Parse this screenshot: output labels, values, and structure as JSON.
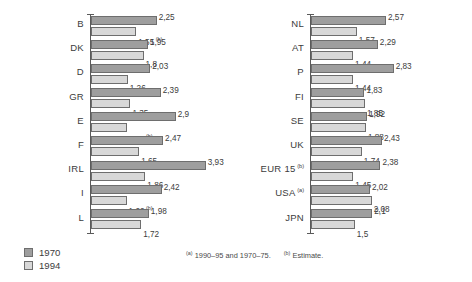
{
  "chart_data": {
    "type": "bar",
    "orientation": "horizontal",
    "title": "",
    "xlabel": "",
    "ylabel": "",
    "grid": false,
    "xlim": [
      0,
      4
    ],
    "legend_position": "bottom-left",
    "series": [
      {
        "name": "1970",
        "color": "#9e9e9e"
      },
      {
        "name": "1994",
        "color": "#d8d8d8"
      }
    ],
    "panels": [
      {
        "id": "left",
        "categories": [
          "B",
          "DK",
          "D",
          "GR",
          "E",
          "F",
          "IRL",
          "I",
          "L"
        ],
        "values_1970": [
          2.25,
          1.95,
          2.03,
          2.39,
          2.9,
          2.47,
          3.93,
          2.42,
          1.98
        ],
        "values_1994": [
          1.55,
          1.8,
          1.26,
          1.35,
          1.22,
          1.65,
          1.86,
          1.22,
          1.72
        ],
        "rows": [
          {
            "label": "B",
            "label_note": "",
            "a": {
              "value": 2.25,
              "text": "2,25",
              "note": ""
            },
            "b": {
              "value": 1.55,
              "text": "1,55",
              "note": "(b)"
            }
          },
          {
            "label": "DK",
            "label_note": "",
            "a": {
              "value": 1.95,
              "text": "1,95",
              "note": ""
            },
            "b": {
              "value": 1.8,
              "text": "1,8",
              "note": ""
            }
          },
          {
            "label": "D",
            "label_note": "",
            "a": {
              "value": 2.03,
              "text": "2,03",
              "note": ""
            },
            "b": {
              "value": 1.26,
              "text": "1,26",
              "note": ""
            }
          },
          {
            "label": "GR",
            "label_note": "",
            "a": {
              "value": 2.39,
              "text": "2,39",
              "note": ""
            },
            "b": {
              "value": 1.35,
              "text": "1,35",
              "note": ""
            }
          },
          {
            "label": "E",
            "label_note": "",
            "a": {
              "value": 2.9,
              "text": "2,9",
              "note": ""
            },
            "b": {
              "value": 1.22,
              "text": "1,22",
              "note": "(b)"
            }
          },
          {
            "label": "F",
            "label_note": "",
            "a": {
              "value": 2.47,
              "text": "2,47",
              "note": ""
            },
            "b": {
              "value": 1.65,
              "text": "1,65",
              "note": ""
            }
          },
          {
            "label": "IRL",
            "label_note": "",
            "a": {
              "value": 3.93,
              "text": "3,93",
              "note": ""
            },
            "b": {
              "value": 1.86,
              "text": "1,86",
              "note": ""
            }
          },
          {
            "label": "I",
            "label_note": "",
            "a": {
              "value": 2.42,
              "text": "2,42",
              "note": ""
            },
            "b": {
              "value": 1.22,
              "text": "1,22",
              "note": "(b)"
            }
          },
          {
            "label": "L",
            "label_note": "",
            "a": {
              "value": 1.98,
              "text": "1,98",
              "note": ""
            },
            "b": {
              "value": 1.72,
              "text": "1,72",
              "note": ""
            }
          }
        ]
      },
      {
        "id": "right",
        "categories": [
          "NL",
          "AT",
          "P",
          "FI",
          "SE",
          "UK",
          "EUR 15",
          "USA",
          "JPN"
        ],
        "values_1970": [
          2.57,
          2.29,
          2.83,
          1.83,
          1.92,
          2.43,
          2.38,
          2.02,
          2.1
        ],
        "values_1994": [
          1.57,
          1.44,
          1.44,
          1.85,
          1.88,
          1.74,
          1.45,
          2.08,
          1.5
        ],
        "rows": [
          {
            "label": "NL",
            "label_note": "",
            "a": {
              "value": 2.57,
              "text": "2,57",
              "note": ""
            },
            "b": {
              "value": 1.57,
              "text": "1,57",
              "note": ""
            }
          },
          {
            "label": "AT",
            "label_note": "",
            "a": {
              "value": 2.29,
              "text": "2,29",
              "note": ""
            },
            "b": {
              "value": 1.44,
              "text": "1,44",
              "note": ""
            }
          },
          {
            "label": "P",
            "label_note": "",
            "a": {
              "value": 2.83,
              "text": "2,83",
              "note": ""
            },
            "b": {
              "value": 1.44,
              "text": "1,44",
              "note": ""
            }
          },
          {
            "label": "FI",
            "label_note": "",
            "a": {
              "value": 1.83,
              "text": "1,83",
              "note": ""
            },
            "b": {
              "value": 1.85,
              "text": "1,85",
              "note": ""
            }
          },
          {
            "label": "SE",
            "label_note": "",
            "a": {
              "value": 1.92,
              "text": "1,92",
              "note": ""
            },
            "b": {
              "value": 1.88,
              "text": "1,88",
              "note": ""
            }
          },
          {
            "label": "UK",
            "label_note": "",
            "a": {
              "value": 2.43,
              "text": "2,43",
              "note": ""
            },
            "b": {
              "value": 1.74,
              "text": "1,74",
              "note": ""
            }
          },
          {
            "label": "EUR 15",
            "label_note": "(b)",
            "a": {
              "value": 2.38,
              "text": "2,38",
              "note": ""
            },
            "b": {
              "value": 1.45,
              "text": "1,45",
              "note": ""
            }
          },
          {
            "label": "USA",
            "label_note": "(a)",
            "a": {
              "value": 2.02,
              "text": "2,02",
              "note": ""
            },
            "b": {
              "value": 2.08,
              "text": "2,08",
              "note": ""
            }
          },
          {
            "label": "JPN",
            "label_note": "",
            "a": {
              "value": 2.1,
              "text": "2,1",
              "note": ""
            },
            "b": {
              "value": 1.5,
              "text": "1,5",
              "note": ""
            }
          }
        ]
      }
    ]
  },
  "legend": {
    "items": [
      {
        "label": "1970",
        "color": "#9e9e9e"
      },
      {
        "label": "1994",
        "color": "#d8d8d8"
      }
    ]
  },
  "footnotes": {
    "first_marker": "(a)",
    "first_text": "1990–95 and 1970–75.",
    "second_marker": "(b)",
    "second_text": "Estimate."
  }
}
